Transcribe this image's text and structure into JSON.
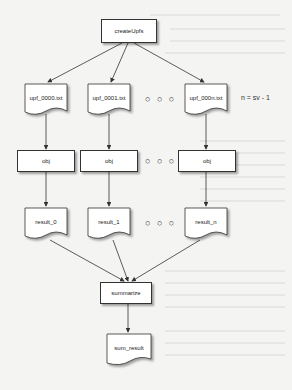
{
  "diagram": {
    "root": {
      "label": "createUpfs"
    },
    "files": [
      {
        "label": "upf_0000.txt"
      },
      {
        "label": "upf_0001.txt"
      },
      {
        "label": "upf_000n.txt"
      }
    ],
    "objs": [
      {
        "label": "obj"
      },
      {
        "label": "obj"
      },
      {
        "label": "obj"
      }
    ],
    "results": [
      {
        "label": "result_0"
      },
      {
        "label": "result_1"
      },
      {
        "label": "result_n"
      }
    ],
    "ellipsis": "○ ○ ○",
    "note": "n = sv - 1",
    "summarize": {
      "label": "summarize"
    },
    "final": {
      "label": "sum_result"
    },
    "edges": [
      [
        "createUpfs",
        "upf_0000.txt"
      ],
      [
        "createUpfs",
        "upf_0001.txt"
      ],
      [
        "createUpfs",
        "upf_000n.txt"
      ],
      [
        "upf_0000.txt",
        "obj"
      ],
      [
        "upf_0001.txt",
        "obj"
      ],
      [
        "upf_000n.txt",
        "obj"
      ],
      [
        "obj",
        "result_0"
      ],
      [
        "obj",
        "result_1"
      ],
      [
        "obj",
        "result_n"
      ],
      [
        "result_0",
        "summarize"
      ],
      [
        "result_1",
        "summarize"
      ],
      [
        "result_n",
        "summarize"
      ],
      [
        "summarize",
        "sum_result"
      ]
    ]
  }
}
